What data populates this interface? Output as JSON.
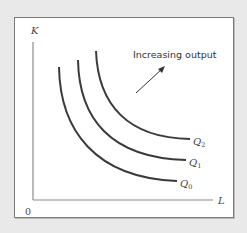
{
  "axes": {
    "y_label": "K",
    "x_label": "L",
    "origin_label": "0"
  },
  "annotation": {
    "text": "Increasing output",
    "arrow_direction": "up-right"
  },
  "curves": [
    {
      "name": "Q0",
      "label_main": "Q",
      "label_sub": "0",
      "order": 0
    },
    {
      "name": "Q1",
      "label_main": "Q",
      "label_sub": "1",
      "order": 1
    },
    {
      "name": "Q2",
      "label_main": "Q",
      "label_sub": "2",
      "order": 2
    }
  ],
  "colors": {
    "curve": "#3a3a3a",
    "axis": "#8a8a8a",
    "background": "#e9e9e9",
    "panel": "#ffffff"
  }
}
